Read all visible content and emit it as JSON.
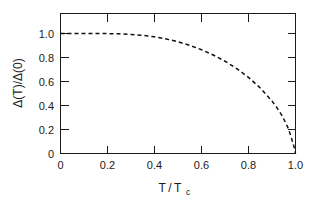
{
  "chart_data": {
    "type": "line",
    "title": "",
    "subtitle": "",
    "xlabel": "T/Tc",
    "xlabel_base": "T / T",
    "xlabel_sub": "c",
    "ylabel": "Δ(T)/Δ(0)",
    "xlim": [
      0,
      1.0
    ],
    "ylim": [
      0,
      1.2
    ],
    "grid": false,
    "legend": null,
    "legend_position": "none",
    "frame": "box",
    "tick_direction": "in",
    "line_style": "dashed",
    "line_color": "#111111",
    "xticks": [
      0,
      0.2,
      0.4,
      0.6,
      0.8,
      1.0
    ],
    "xtick_labels": [
      "0",
      "0.2",
      "0.4",
      "0.6",
      "0.8",
      "1.0"
    ],
    "yticks": [
      0,
      0.2,
      0.4,
      0.6,
      0.8,
      1.0
    ],
    "ytick_labels": [
      "0",
      "0.2",
      "0.4",
      "0.6",
      "0.8",
      "1.0"
    ],
    "ytick_minor": [
      1.2
    ],
    "series": [
      {
        "name": "BCS gap",
        "x": [
          0.0,
          0.05,
          0.1,
          0.15,
          0.2,
          0.25,
          0.3,
          0.35,
          0.4,
          0.45,
          0.5,
          0.55,
          0.6,
          0.65,
          0.7,
          0.75,
          0.8,
          0.85,
          0.9,
          0.92,
          0.94,
          0.96,
          0.97,
          0.98,
          0.99,
          0.995,
          1.0
        ],
        "y": [
          1.0,
          1.0,
          1.0,
          0.9998,
          0.999,
          0.997,
          0.9925,
          0.9845,
          0.972,
          0.9545,
          0.931,
          0.9015,
          0.865,
          0.821,
          0.769,
          0.7075,
          0.6345,
          0.5465,
          0.437,
          0.3845,
          0.324,
          0.25,
          0.204,
          0.148,
          0.08,
          0.047,
          0.0
        ]
      }
    ]
  },
  "axes": {
    "y_axis_title": "Δ(T)/Δ(0)",
    "x_axis_title_base": "T / T",
    "x_axis_title_sub": "c"
  }
}
